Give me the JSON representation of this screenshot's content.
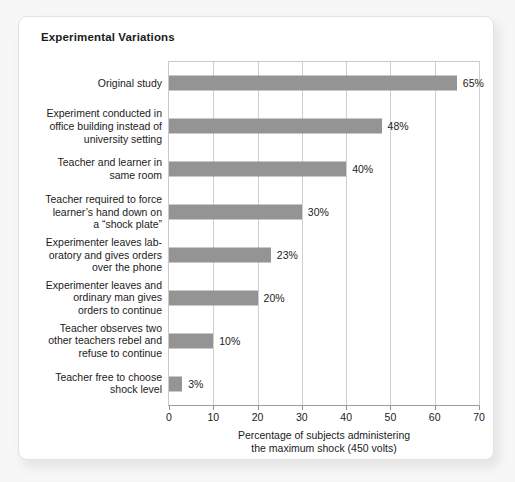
{
  "card": {
    "title": "Experimental Variations"
  },
  "chart_data": {
    "type": "bar",
    "orientation": "horizontal",
    "title": "Experimental Variations",
    "xlabel": "Percentage of subjects administering the maximum shock (450 volts)",
    "xlabel_lines": [
      "Percentage of subjects administering",
      "the maximum shock (450 volts)"
    ],
    "ylabel": "",
    "xlim": [
      0,
      70
    ],
    "xticks": [
      0,
      10,
      20,
      30,
      40,
      50,
      60,
      70
    ],
    "xtick_labels": [
      "0",
      "10",
      "20",
      "30",
      "40",
      "50",
      "60",
      "70"
    ],
    "grid": "vertical",
    "legend": "none",
    "bar_color": "#949494",
    "categories": [
      "Original study",
      "Experiment conducted in office building instead of university setting",
      "Teacher and learner in same room",
      "Teacher required to force learner's hand down on a “shock plate”",
      "Experimenter leaves laboratory and gives orders over the phone",
      "Experimenter leaves and ordinary man gives orders to continue",
      "Teacher observes two other teachers rebel and refuse to continue",
      "Teacher free to choose shock level"
    ],
    "category_lines": [
      [
        "Original study"
      ],
      [
        "Experiment conducted in",
        "office building instead of",
        "university setting"
      ],
      [
        "Teacher and learner in",
        "same room"
      ],
      [
        "Teacher required to force",
        "learner’s hand down on",
        "a “shock plate”"
      ],
      [
        "Experimenter leaves lab-",
        "oratory and gives orders",
        "over the phone"
      ],
      [
        "Experimenter leaves and",
        "ordinary man gives",
        "orders to continue"
      ],
      [
        "Teacher observes two",
        "other teachers rebel and",
        "refuse to continue"
      ],
      [
        "Teacher free to choose",
        "shock level"
      ]
    ],
    "values": [
      65,
      48,
      40,
      30,
      23,
      20,
      10,
      3
    ],
    "value_labels": [
      "65%",
      "48%",
      "40%",
      "30%",
      "23%",
      "20%",
      "10%",
      "3%"
    ]
  }
}
